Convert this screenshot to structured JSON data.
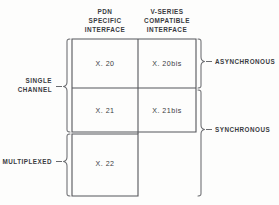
{
  "diagram": {
    "colors": {
      "background": "#fdfdfc",
      "line": "#55565a",
      "brace": "#6a6b6f",
      "text": "#3a3b3f"
    },
    "column_headers": [
      {
        "id": "pdn-specific-interface",
        "lines": [
          "PDN",
          "SPECIFIC",
          "INTERFACE"
        ]
      },
      {
        "id": "v-series-compatible-interface",
        "lines": [
          "V-SERIES",
          "COMPATIBLE",
          "INTERFACE"
        ]
      }
    ],
    "row_labels": [
      {
        "id": "single-channel",
        "lines": [
          "SINGLE",
          "CHANNEL"
        ]
      },
      {
        "id": "multiplexed",
        "lines": [
          "MULTIPLEXED"
        ]
      }
    ],
    "right_labels": [
      {
        "id": "asynchronous",
        "text": "ASYNCHRONOUS"
      },
      {
        "id": "synchronous",
        "text": "SYNCHRONOUS"
      }
    ],
    "cells": [
      {
        "id": "cell-x20",
        "text": "X. 20",
        "row": 0,
        "col": 0
      },
      {
        "id": "cell-x20bis",
        "text": "X. 20bis",
        "row": 0,
        "col": 1
      },
      {
        "id": "cell-x21",
        "text": "X. 21",
        "row": 1,
        "col": 0
      },
      {
        "id": "cell-x21bis",
        "text": "X. 21bis",
        "row": 1,
        "col": 1
      },
      {
        "id": "cell-x22",
        "text": "X. 22",
        "row": 2,
        "col": 0
      }
    ]
  }
}
